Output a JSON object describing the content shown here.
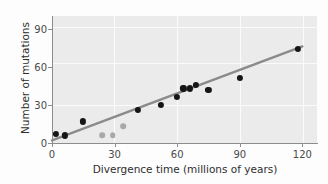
{
  "chart_data": {
    "type": "scatter",
    "title": "",
    "xlabel": "Divergence time (millions of years)",
    "ylabel": "Number of mutations",
    "xlim": [
      0,
      127
    ],
    "ylim": [
      0,
      100
    ],
    "xticks": [
      0,
      30,
      60,
      90,
      120
    ],
    "xticklabels": [
      "0",
      "30",
      "60",
      "90",
      "120"
    ],
    "yticks": [
      0,
      30,
      60,
      90
    ],
    "yticklabels": [
      "0",
      "30",
      "60",
      "90"
    ],
    "grid": true,
    "legend": "none",
    "series": [
      {
        "name": "primary-data-points",
        "marker": "filled-circle",
        "color": "#151515",
        "points": [
          {
            "x": 2,
            "y": 7
          },
          {
            "x": 6,
            "y": 6
          },
          {
            "x": 15,
            "y": 17
          },
          {
            "x": 41,
            "y": 26
          },
          {
            "x": 52,
            "y": 30
          },
          {
            "x": 60,
            "y": 36
          },
          {
            "x": 63,
            "y": 43
          },
          {
            "x": 66,
            "y": 43
          },
          {
            "x": 69,
            "y": 46
          },
          {
            "x": 75,
            "y": 42
          },
          {
            "x": 90,
            "y": 51
          },
          {
            "x": 118,
            "y": 74
          }
        ]
      },
      {
        "name": "secondary-data-points",
        "marker": "filled-circle",
        "color": "#a8a8a8",
        "points": [
          {
            "x": 24,
            "y": 6
          },
          {
            "x": 29,
            "y": 6
          },
          {
            "x": 34,
            "y": 13
          }
        ]
      }
    ],
    "trendline": {
      "name": "regression-line",
      "color": "#8a8a8a",
      "x0": 0,
      "y0": 2,
      "x1": 120,
      "y1": 76
    }
  },
  "style": {
    "panel_background": "#ebebeb",
    "figure_background": "#fdfdfd",
    "gridline_color": "#fbfbfb",
    "axis_color": "#8c8c8c",
    "tick_label_color": "#4a4a4a",
    "axis_label_color": "#2e2e2e"
  }
}
